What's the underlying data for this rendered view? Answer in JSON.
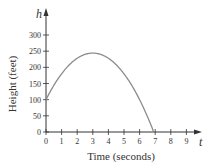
{
  "chart_data": {
    "type": "line",
    "title": "",
    "xlabel": "Time (seconds)",
    "ylabel": "Height (feet)",
    "x_axis_symbol": "t",
    "y_axis_symbol": "h",
    "xlim": [
      0,
      9
    ],
    "ylim": [
      0,
      300
    ],
    "x_ticks": [
      0,
      1,
      2,
      3,
      4,
      5,
      6,
      7,
      8,
      9
    ],
    "y_ticks": [
      0,
      50,
      100,
      150,
      200,
      250,
      300
    ],
    "grid": false,
    "legend": null,
    "series": [
      {
        "name": "h(t) = -16t^2 + 96t + 100",
        "x": [
          0,
          0.5,
          1,
          1.5,
          2,
          2.5,
          3,
          3.5,
          4,
          4.5,
          5,
          5.5,
          6,
          6.5,
          6.87
        ],
        "values": [
          100,
          144,
          180,
          208,
          228,
          240,
          244,
          240,
          228,
          208,
          180,
          144,
          100,
          48,
          0
        ]
      }
    ]
  },
  "colors": {
    "curve": "#8c8c8c",
    "axis": "#333333"
  }
}
